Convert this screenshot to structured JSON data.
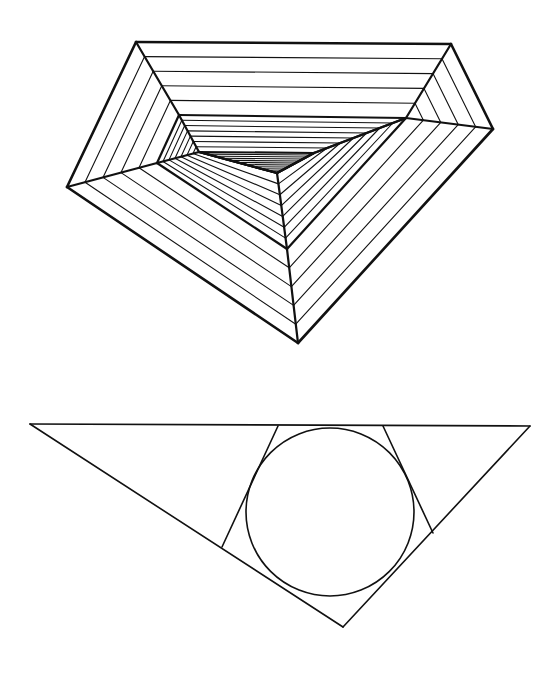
{
  "colors": {
    "background": "#ffffff",
    "ink": "#111111"
  },
  "figures": {
    "nested_pentagon": {
      "description": "Pentagon subdivided into nested bands of parallel lines converging to a point",
      "levels": [
        [
          [
            136,
            42
          ],
          [
            451,
            44
          ],
          [
            493,
            129
          ],
          [
            298,
            343
          ],
          [
            67,
            187
          ]
        ],
        [
          [
            179,
            115
          ],
          [
            406,
            118
          ],
          [
            406,
            118
          ],
          [
            287,
            249
          ],
          [
            157,
            163
          ]
        ],
        [
          [
            199,
            152
          ],
          [
            314,
            153
          ],
          [
            314,
            153
          ],
          [
            277,
            173
          ],
          [
            199,
            152
          ]
        ],
        [
          [
            277,
            173
          ],
          [
            277,
            173
          ],
          [
            277,
            173
          ],
          [
            277,
            173
          ],
          [
            277,
            173
          ]
        ]
      ],
      "band_lines": [
        5,
        7,
        10
      ],
      "bold_width": 2.6,
      "thin_width": 1.1
    },
    "triangle_incircle": {
      "description": "Scalene triangle with inscribed circle and two tangent lines cutting off corners",
      "triangle": [
        [
          30,
          424
        ],
        [
          530,
          426
        ],
        [
          343,
          627
        ]
      ],
      "circle": {
        "cx": 330,
        "cy": 512,
        "r": 84
      },
      "tangent_lines": [
        [
          [
            278,
            426
          ],
          [
            222,
            547
          ]
        ],
        [
          [
            383,
            426
          ],
          [
            433,
            533
          ]
        ]
      ],
      "stroke_width": 1.6
    }
  }
}
